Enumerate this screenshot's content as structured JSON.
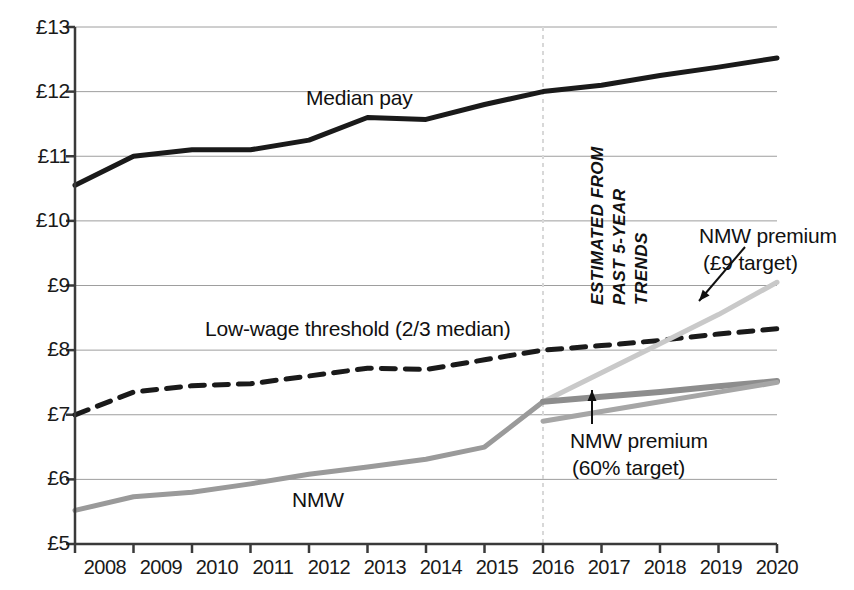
{
  "chart_data": {
    "type": "line",
    "title": "",
    "xlabel": "",
    "ylabel": "",
    "xlim": [
      2008,
      2020
    ],
    "ylim": [
      5,
      13
    ],
    "grid": true,
    "legend_position": "inline-labels",
    "y_tick_labels": [
      "£13",
      "£12",
      "£11",
      "£10",
      "£9",
      "£8",
      "£7",
      "£6",
      "£5"
    ],
    "y_ticks": [
      13,
      12,
      11,
      10,
      9,
      8,
      7,
      6,
      5
    ],
    "x_tick_labels": [
      "2008",
      "2009",
      "2010",
      "2011",
      "2012",
      "2013",
      "2014",
      "2015",
      "2016",
      "2017",
      "2018",
      "2019",
      "2020"
    ],
    "x_ticks": [
      2008,
      2009,
      2010,
      2011,
      2012,
      2013,
      2014,
      2015,
      2016,
      2017,
      2018,
      2019,
      2020
    ],
    "forecast_divider_x": 2016,
    "series": [
      {
        "name": "Median pay",
        "style": "solid",
        "color": "#1a1a1a",
        "width": 5,
        "x": [
          2008,
          2009,
          2010,
          2011,
          2012,
          2013,
          2014,
          2015,
          2016,
          2017,
          2018,
          2019,
          2020
        ],
        "values": [
          10.55,
          11.0,
          11.1,
          11.1,
          11.25,
          11.6,
          11.57,
          11.8,
          12.0,
          12.1,
          12.25,
          12.38,
          12.52
        ]
      },
      {
        "name": "Low-wage threshold (2/3 median)",
        "style": "dashed",
        "color": "#1a1a1a",
        "width": 5,
        "x": [
          2008,
          2009,
          2010,
          2011,
          2012,
          2013,
          2014,
          2015,
          2016,
          2017,
          2018,
          2019,
          2020
        ],
        "values": [
          7.0,
          7.35,
          7.45,
          7.48,
          7.6,
          7.72,
          7.7,
          7.85,
          8.0,
          8.07,
          8.15,
          8.25,
          8.33
        ]
      },
      {
        "name": "NMW",
        "style": "solid",
        "color": "#9a9a9a",
        "width": 5,
        "x": [
          2008,
          2009,
          2010,
          2011,
          2012,
          2013,
          2014,
          2015,
          2016
        ],
        "values": [
          5.52,
          5.73,
          5.8,
          5.93,
          6.08,
          6.19,
          6.31,
          6.5,
          7.2
        ]
      },
      {
        "name": "NMW premium (£9 target)",
        "style": "solid",
        "color": "#c9c9c9",
        "width": 5,
        "x": [
          2016,
          2017,
          2018,
          2019,
          2020
        ],
        "values": [
          7.2,
          7.65,
          8.1,
          8.55,
          9.05
        ]
      },
      {
        "name": "NMW premium (60% target)",
        "style": "solid",
        "color": "#8d8d8d",
        "width": 6,
        "x": [
          2016,
          2017,
          2018,
          2019,
          2020
        ],
        "values": [
          7.2,
          7.28,
          7.35,
          7.44,
          7.52
        ]
      },
      {
        "name": "NMW projection lower",
        "style": "solid",
        "color": "#a6a6a6",
        "width": 5,
        "x": [
          2016,
          2017,
          2018,
          2019,
          2020
        ],
        "values": [
          6.9,
          7.05,
          7.2,
          7.35,
          7.5
        ]
      }
    ],
    "annotations": [
      {
        "text": "ESTIMATED FROM",
        "rotated": true
      },
      {
        "text": "PAST 5-YEAR",
        "rotated": true
      },
      {
        "text": "TRENDS",
        "rotated": true
      }
    ]
  },
  "labels": {
    "median_pay": "Median pay",
    "low_wage_threshold": "Low-wage threshold (2/3 median)",
    "nmw": "NMW",
    "nmw_premium_9_line1": "NMW premium",
    "nmw_premium_9_line2": "(£9 target)",
    "nmw_premium_60_line1": "NMW premium",
    "nmw_premium_60_line2": "(60% target)",
    "estimated_line1": "ESTIMATED FROM",
    "estimated_line2": "PAST 5-YEAR",
    "estimated_line3": "TRENDS"
  },
  "axis": {
    "y": {
      "t13": "£13",
      "t12": "£12",
      "t11": "£11",
      "t10": "£10",
      "t9": "£9",
      "t8": "£8",
      "t7": "£7",
      "t6": "£6",
      "t5": "£5"
    },
    "x": {
      "t2008": "2008",
      "t2009": "2009",
      "t2010": "2010",
      "t2011": "2011",
      "t2012": "2012",
      "t2013": "2013",
      "t2014": "2014",
      "t2015": "2015",
      "t2016": "2016",
      "t2017": "2017",
      "t2018": "2018",
      "t2019": "2019",
      "t2020": "2020"
    }
  },
  "colors": {
    "median_pay": "#1a1a1a",
    "threshold": "#1a1a1a",
    "nmw": "#9a9a9a",
    "premium_9": "#c9c9c9",
    "premium_60": "#8d8d8d",
    "grid": "#9e9e9e",
    "axis": "#3a3a3a",
    "divider": "#d8d8d8"
  }
}
